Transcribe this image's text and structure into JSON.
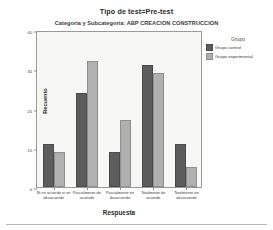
{
  "title": "Tipo de test=Pre-test",
  "subtitle": "Categoría y Subcategoría: ABP CREACION CONSTRUCCION",
  "legend": {
    "title": "Grupo",
    "entries": [
      {
        "label": "Grupo control",
        "color": "#5d5d5d"
      },
      {
        "label": "Grupo experimental",
        "color": "#b0b0b0"
      }
    ]
  },
  "axes": {
    "x_title": "Respuesta",
    "y_title": "Recuento"
  },
  "chart_data": {
    "type": "bar",
    "title": "Tipo de test=Pre-test",
    "subtitle": "Categoría y Subcategoría: ABP CREACION CONSTRUCCION",
    "xlabel": "Respuesta",
    "ylabel": "Recuento",
    "ylim": [
      0,
      40
    ],
    "yticks": [
      0,
      10,
      20,
      30,
      40
    ],
    "ytick_labels": [
      "0",
      "10",
      "20",
      "30",
      "40"
    ],
    "grid": false,
    "legend_position": "right",
    "legend_title": "Grupo",
    "categories": [
      "Ni en acuerdo ni en desacuerdo",
      "Parcialmente de acuerdo",
      "Parcialmente en desacuerdo",
      "Totalmente de acuerdo",
      "Totalmente en desacuerdo"
    ],
    "series": [
      {
        "name": "Grupo control",
        "color": "#5d5d5d",
        "values": [
          11,
          24,
          9,
          31,
          11
        ]
      },
      {
        "name": "Grupo experimental",
        "color": "#b0b0b0",
        "values": [
          9,
          32,
          17,
          29,
          5
        ]
      }
    ]
  }
}
